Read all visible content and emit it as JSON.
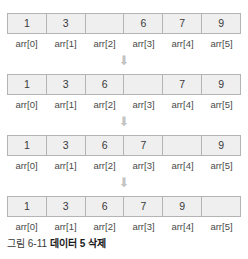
{
  "figure": {
    "caption_number": "그림 6-11",
    "caption_title": "데이터 5 삭제",
    "arrow_glyph": "⬇",
    "indices": [
      "arr[0]",
      "arr[1]",
      "arr[2]",
      "arr[3]",
      "arr[4]",
      "arr[5]"
    ],
    "steps": [
      {
        "name": "step-initial-gap-at-index-2",
        "values": [
          "1",
          "3",
          "",
          "6",
          "7",
          "9"
        ]
      },
      {
        "name": "step-shift-6-left",
        "values": [
          "1",
          "3",
          "6",
          "",
          "7",
          "9"
        ]
      },
      {
        "name": "step-shift-7-left",
        "values": [
          "1",
          "3",
          "6",
          "7",
          "",
          "9"
        ]
      },
      {
        "name": "step-shift-9-left",
        "values": [
          "1",
          "3",
          "6",
          "7",
          "9",
          ""
        ]
      }
    ]
  },
  "colors": {
    "cell_fill": "#efefef",
    "cell_border": "#b4b4b4",
    "arrow": "#c4c4c4",
    "text": "#3a3a3a",
    "caption_title": "#1a1a1a"
  }
}
